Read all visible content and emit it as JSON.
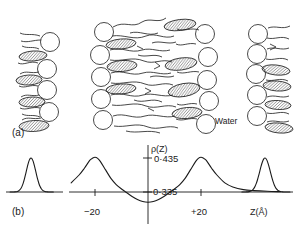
{
  "figure": {
    "panels": [
      {
        "id": "a",
        "label": "(a)",
        "caption_x": 12,
        "caption_y": 136
      },
      {
        "id": "b",
        "label": "(b)",
        "caption_x": 12,
        "caption_y": 215
      }
    ],
    "annotations": {
      "water": "Water"
    },
    "schematic": {
      "description": "lipid bilayer cross-section schematic",
      "head_group_shape": "circle",
      "tail_shape": "hatched-ellipse",
      "chain_shape": "squiggly-line",
      "left_monolayer_head_count": 5,
      "center_bilayer_head_count_left": 6,
      "center_bilayer_head_count_right": 6,
      "right_monolayer_head_count": 6
    }
  },
  "chart_data": {
    "type": "line",
    "title": "",
    "subtitle": "",
    "xlabel": "Z(Å)",
    "ylabel": "ρ(Z)",
    "xlabel_text": "Z(Å)",
    "ylabel_text": "ρ(Z)",
    "grid": false,
    "legend": "none",
    "xlim": [
      -60,
      60
    ],
    "ylim": [
      0.3,
      0.47
    ],
    "xticks": [
      -20,
      20
    ],
    "xticklabels": [
      "−20",
      "+20"
    ],
    "yticks": [
      0.335,
      0.435
    ],
    "yticklabels": [
      "0·335",
      "0·435"
    ],
    "baseline_value": 0.335,
    "peak_value": 0.435,
    "trough_value": 0.305,
    "series": [
      {
        "name": "electron density profile ρ(Z)",
        "x": [
          -60,
          -55,
          -50,
          -45,
          -40,
          -36,
          -32,
          -29,
          -26,
          -24,
          -22,
          -21,
          -20,
          -19,
          -18,
          -16,
          -14,
          -12,
          -10,
          -8,
          -6,
          -4,
          -2,
          0,
          2,
          4,
          6,
          8,
          10,
          12,
          14,
          16,
          18,
          19,
          20,
          21,
          22,
          24,
          26,
          29,
          32,
          36,
          40,
          45,
          50,
          55,
          60
        ],
        "y": [
          0.335,
          0.335,
          0.336,
          0.337,
          0.339,
          0.342,
          0.35,
          0.362,
          0.385,
          0.405,
          0.428,
          0.434,
          0.437,
          0.434,
          0.425,
          0.4,
          0.375,
          0.357,
          0.344,
          0.333,
          0.322,
          0.313,
          0.307,
          0.305,
          0.307,
          0.313,
          0.322,
          0.333,
          0.344,
          0.357,
          0.375,
          0.4,
          0.425,
          0.434,
          0.437,
          0.434,
          0.428,
          0.405,
          0.385,
          0.362,
          0.35,
          0.342,
          0.339,
          0.337,
          0.336,
          0.335,
          0.335
        ]
      }
    ],
    "side_peaks": [
      {
        "name": "left satellite peak",
        "center": -78,
        "peak_value": 0.435,
        "baseline_value": 0.335
      },
      {
        "name": "right satellite peak",
        "center": 78,
        "peak_value": 0.435,
        "baseline_value": 0.335
      }
    ]
  },
  "colors": {
    "ink": "#1a1a1a",
    "background": "#ffffff",
    "hatch": "#444444"
  }
}
